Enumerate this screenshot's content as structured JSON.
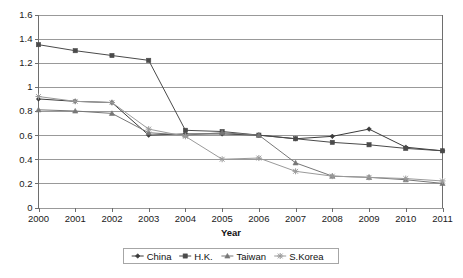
{
  "chart_data": {
    "type": "line",
    "title": "",
    "xlabel": "Year",
    "ylabel": "",
    "grid": true,
    "legend_position": "bottom",
    "categories": [
      "2000",
      "2001",
      "2002",
      "2003",
      "2004",
      "2005",
      "2006",
      "2007",
      "2008",
      "2009",
      "2010",
      "2011"
    ],
    "xlim": [
      2000,
      2011
    ],
    "ylim": [
      0,
      1.6
    ],
    "ytick_labels": [
      "0",
      "0.2",
      "0.4",
      "0.6",
      "0.8",
      "1",
      "1.2",
      "1.4",
      "1.6"
    ],
    "ytick_values": [
      0,
      0.2,
      0.4,
      0.6,
      0.8,
      1.0,
      1.2,
      1.4,
      1.6
    ],
    "series": [
      {
        "name": "China",
        "marker": "diamond",
        "color": "#3b3b3b",
        "values": [
          0.9,
          0.88,
          0.87,
          0.6,
          0.61,
          0.61,
          0.6,
          0.57,
          0.59,
          0.65,
          0.5,
          0.47
        ]
      },
      {
        "name": "H.K.",
        "marker": "square",
        "color": "#4a4a4a",
        "values": [
          1.35,
          1.3,
          1.26,
          1.22,
          0.64,
          0.63,
          0.6,
          0.57,
          0.54,
          0.52,
          0.49,
          0.47
        ]
      },
      {
        "name": "Taiwan",
        "marker": "triangle",
        "color": "#777777",
        "values": [
          0.81,
          0.8,
          0.78,
          0.62,
          0.6,
          0.62,
          0.6,
          0.37,
          0.26,
          0.25,
          0.23,
          0.2
        ]
      },
      {
        "name": "S.Korea",
        "marker": "x",
        "color": "#9a9a9a",
        "values": [
          0.92,
          0.88,
          0.87,
          0.65,
          0.59,
          0.4,
          0.41,
          0.3,
          0.26,
          0.25,
          0.24,
          0.22
        ]
      }
    ]
  },
  "legend": {
    "entries": [
      "China",
      "H.K.",
      "Taiwan",
      "S.Korea"
    ]
  },
  "axis": {
    "x_title": "Year"
  }
}
